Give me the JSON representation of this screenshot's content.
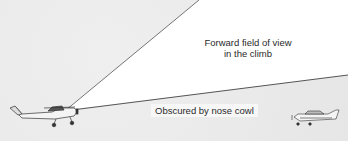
{
  "diagram": {
    "labels": {
      "forward_view_line1": "Forward field of view",
      "forward_view_line2": "in the climb",
      "obscured": "Obscured by nose cowl"
    },
    "elements": {
      "climbing_aircraft": "high-wing single-engine airplane (climbing)",
      "distant_aircraft": "low-wing airplane ahead, hidden below cowl line"
    },
    "colors": {
      "field_of_view": "#ffffff",
      "background": "#e8e8e8",
      "lines": "#555555"
    }
  }
}
